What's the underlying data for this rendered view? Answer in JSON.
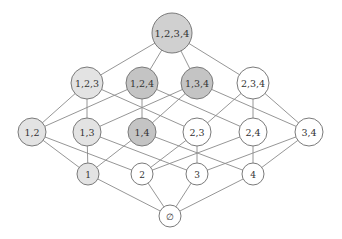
{
  "diagram": {
    "type": "hasse-diagram",
    "colors": {
      "edge": "#8a8a8a",
      "stroke": "#7a7a7a",
      "white": "#ffffff",
      "light": "#e3e3e3",
      "medium": "#d0d0d0",
      "dark": "#c4c4c4"
    },
    "nodes": [
      {
        "id": "1234",
        "label": "1,2,3,4",
        "x": 172,
        "y": 33,
        "r": 20,
        "fill": "medium",
        "fontSize": 10
      },
      {
        "id": "123",
        "label": "1,2,3",
        "x": 87,
        "y": 83,
        "r": 16,
        "fill": "light",
        "fontSize": 9.5
      },
      {
        "id": "124",
        "label": "1,2,4",
        "x": 142,
        "y": 83,
        "r": 16,
        "fill": "dark",
        "fontSize": 9.5
      },
      {
        "id": "134",
        "label": "1,3,4",
        "x": 197,
        "y": 83,
        "r": 16,
        "fill": "dark",
        "fontSize": 9.5
      },
      {
        "id": "234",
        "label": "2,3,4",
        "x": 253,
        "y": 83,
        "r": 16,
        "fill": "white",
        "fontSize": 9.5
      },
      {
        "id": "12",
        "label": "1,2",
        "x": 32,
        "y": 132,
        "r": 14,
        "fill": "light",
        "fontSize": 9.5
      },
      {
        "id": "13",
        "label": "1,3",
        "x": 87,
        "y": 132,
        "r": 14,
        "fill": "light",
        "fontSize": 9.5
      },
      {
        "id": "14",
        "label": "1,4",
        "x": 142,
        "y": 132,
        "r": 14,
        "fill": "dark",
        "fontSize": 9.5
      },
      {
        "id": "23",
        "label": "2,3",
        "x": 197,
        "y": 132,
        "r": 14,
        "fill": "white",
        "fontSize": 9.5
      },
      {
        "id": "24",
        "label": "2,4",
        "x": 253,
        "y": 132,
        "r": 14,
        "fill": "white",
        "fontSize": 9.5
      },
      {
        "id": "34",
        "label": "3,4",
        "x": 309,
        "y": 132,
        "r": 14,
        "fill": "white",
        "fontSize": 9.5
      },
      {
        "id": "1",
        "label": "1",
        "x": 88,
        "y": 174,
        "r": 11,
        "fill": "light",
        "fontSize": 9
      },
      {
        "id": "2",
        "label": "2",
        "x": 142,
        "y": 174,
        "r": 11,
        "fill": "white",
        "fontSize": 9
      },
      {
        "id": "3",
        "label": "3",
        "x": 197,
        "y": 174,
        "r": 11,
        "fill": "white",
        "fontSize": 9
      },
      {
        "id": "4",
        "label": "4",
        "x": 253,
        "y": 174,
        "r": 11,
        "fill": "white",
        "fontSize": 9
      },
      {
        "id": "empty",
        "label": "∅",
        "x": 170,
        "y": 216,
        "r": 11,
        "fill": "white",
        "fontSize": 9
      }
    ],
    "edges": [
      [
        "1234",
        "123"
      ],
      [
        "1234",
        "124"
      ],
      [
        "1234",
        "134"
      ],
      [
        "1234",
        "234"
      ],
      [
        "123",
        "12"
      ],
      [
        "123",
        "13"
      ],
      [
        "123",
        "23"
      ],
      [
        "124",
        "12"
      ],
      [
        "124",
        "14"
      ],
      [
        "124",
        "24"
      ],
      [
        "134",
        "13"
      ],
      [
        "134",
        "14"
      ],
      [
        "134",
        "34"
      ],
      [
        "234",
        "23"
      ],
      [
        "234",
        "24"
      ],
      [
        "234",
        "34"
      ],
      [
        "12",
        "1"
      ],
      [
        "12",
        "2"
      ],
      [
        "13",
        "1"
      ],
      [
        "13",
        "3"
      ],
      [
        "14",
        "1"
      ],
      [
        "14",
        "4"
      ],
      [
        "23",
        "2"
      ],
      [
        "23",
        "3"
      ],
      [
        "24",
        "2"
      ],
      [
        "24",
        "4"
      ],
      [
        "34",
        "3"
      ],
      [
        "34",
        "4"
      ],
      [
        "1",
        "empty"
      ],
      [
        "2",
        "empty"
      ],
      [
        "3",
        "empty"
      ],
      [
        "4",
        "empty"
      ]
    ]
  }
}
